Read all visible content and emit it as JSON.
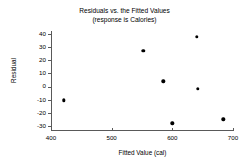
{
  "chart_data": {
    "type": "scatter",
    "title": "Residuals vs. the Fitted Values",
    "subtitle": "(response is Calories)",
    "xlabel": "Fitted Value (cal)",
    "ylabel": "Residual",
    "xlim": [
      400,
      700
    ],
    "ylim": [
      -30,
      40
    ],
    "xticks": [
      400,
      500,
      600,
      700
    ],
    "yticks": [
      40,
      30,
      20,
      10,
      0,
      -10,
      -20,
      -30
    ],
    "xtick_labels": [
      "400",
      "500",
      "600",
      "700"
    ],
    "ytick_labels": [
      "40",
      "30",
      "20",
      "10",
      "0",
      "-10",
      "-20",
      "-30"
    ],
    "grid": false,
    "legend": false,
    "marker": "filled-circle",
    "marker_color": "#000000",
    "axis_color": "#595959",
    "points": [
      {
        "x": 421,
        "y": -10.5
      },
      {
        "x": 552,
        "y": 27
      },
      {
        "x": 585,
        "y": 4
      },
      {
        "x": 600,
        "y": -28
      },
      {
        "x": 640,
        "y": 38
      },
      {
        "x": 642,
        "y": -1.5
      },
      {
        "x": 684,
        "y": -25
      }
    ]
  }
}
